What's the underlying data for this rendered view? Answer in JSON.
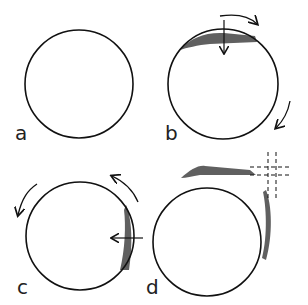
{
  "panels": [
    {
      "id": "a",
      "label": "a"
    },
    {
      "id": "b",
      "label": "b"
    },
    {
      "id": "c",
      "label": "c"
    },
    {
      "id": "d",
      "label": "d"
    }
  ],
  "colors": {
    "stroke": "#111111",
    "shade": "#444444",
    "background": "#ffffff"
  }
}
